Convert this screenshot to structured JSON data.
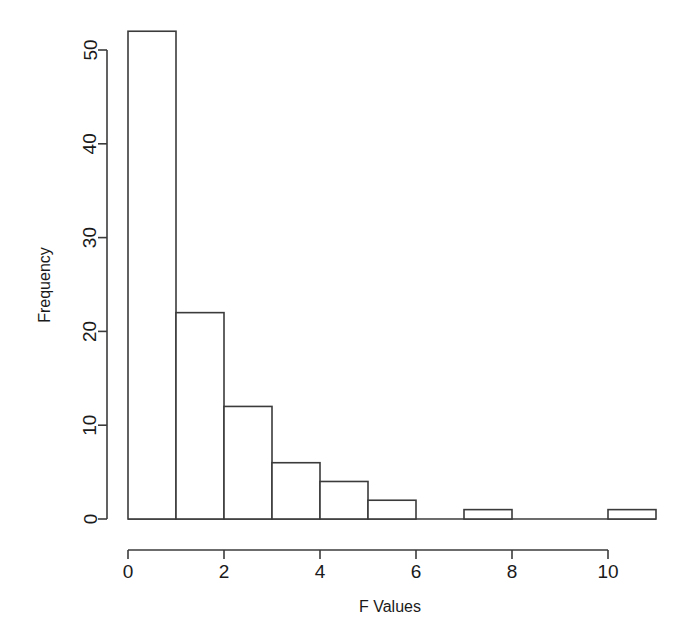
{
  "chart_data": {
    "type": "bar",
    "title": "",
    "subtitle": "",
    "xlabel": "F Values",
    "ylabel": "Frequency",
    "categories": [
      "0-1",
      "1-2",
      "2-3",
      "3-4",
      "4-5",
      "5-6",
      "6-7",
      "7-8",
      "8-9",
      "9-10",
      "10-11"
    ],
    "bin_edges": [
      0,
      1,
      2,
      3,
      4,
      5,
      6,
      7,
      8,
      9,
      10,
      11
    ],
    "bin_width": 1,
    "values": [
      52,
      22,
      12,
      6,
      4,
      2,
      0,
      1,
      0,
      0,
      1
    ],
    "xlim": [
      0,
      11
    ],
    "ylim": [
      0,
      52
    ],
    "x_ticks": [
      0,
      2,
      4,
      6,
      8,
      10
    ],
    "x_tick_labels": [
      "0",
      "2",
      "4",
      "6",
      "8",
      "10"
    ],
    "y_ticks": [
      0,
      10,
      20,
      30,
      40,
      50
    ],
    "y_tick_labels": [
      "0",
      "10",
      "20",
      "30",
      "40",
      "50"
    ],
    "grid": false,
    "legend": null,
    "legend_position": "none",
    "bar_fill": "#ffffff",
    "bar_stroke": "#3b3b3b",
    "axis_color": "#3b3b3b",
    "background": "#ffffff",
    "annotations": []
  },
  "axes": {
    "x_title": "F Values",
    "y_title": "Frequency"
  },
  "x_ticks": [
    {
      "label": "0"
    },
    {
      "label": "2"
    },
    {
      "label": "4"
    },
    {
      "label": "6"
    },
    {
      "label": "8"
    },
    {
      "label": "10"
    }
  ],
  "y_ticks": [
    {
      "label": "0"
    },
    {
      "label": "10"
    },
    {
      "label": "20"
    },
    {
      "label": "30"
    },
    {
      "label": "40"
    },
    {
      "label": "50"
    }
  ]
}
